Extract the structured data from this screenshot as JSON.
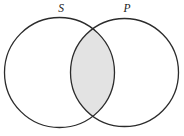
{
  "diagram": {
    "kind": "venn-diagram",
    "background_color": "#ffffff",
    "stroke_color": "#2b2b2b",
    "stroke_width": 1.3,
    "shade_color": "#e3e3e3",
    "width": 184,
    "height": 136,
    "sets": [
      {
        "id": "S",
        "label": "S",
        "label_x": 61,
        "label_y": 12,
        "circle": {
          "cx": 59.5,
          "cy": 72.5,
          "r": 55
        },
        "fill": "#ffffff"
      },
      {
        "id": "P",
        "label": "P",
        "label_x": 127,
        "label_y": 12,
        "circle": {
          "cx": 124.5,
          "cy": 72.5,
          "r": 54
        },
        "fill": "#ffffff"
      }
    ],
    "intersection": {
      "id": "S-and-P",
      "shaded": true,
      "fill": "#e3e3e3",
      "crossing_points": [
        {
          "x": 93,
          "y": 26
        },
        {
          "x": 93,
          "y": 118
        }
      ]
    }
  }
}
